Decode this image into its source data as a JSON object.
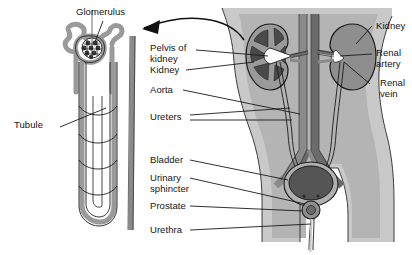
{
  "figure": {
    "type": "anatomical-diagram"
  },
  "labels": {
    "glomerulus": "Glomerulus",
    "tubule": "Tubule",
    "pelvis_of_kidney": "Pelvis of\nkidney",
    "kidney_left": "Kidney",
    "aorta": "Aorta",
    "ureters": "Ureters",
    "bladder": "Bladder",
    "urinary_sphincter": "Urinary\nsphincter",
    "prostate": "Prostate",
    "urethra": "Urethra",
    "kidney_right": "Kidney",
    "renal_artery": "Renal\nartery",
    "renal_vein": "Renal\nvein"
  },
  "colors": {
    "body_outer": "#c9c9c9",
    "body_inner": "#b4b4b4",
    "organ_mid": "#8e8e8e",
    "organ_dark": "#585858",
    "vessel_gray": "#8a8a8a",
    "vessel_dark": "#6b6b6b",
    "outline": "#1a1a1a",
    "white": "#ffffff",
    "text": "#141414"
  }
}
